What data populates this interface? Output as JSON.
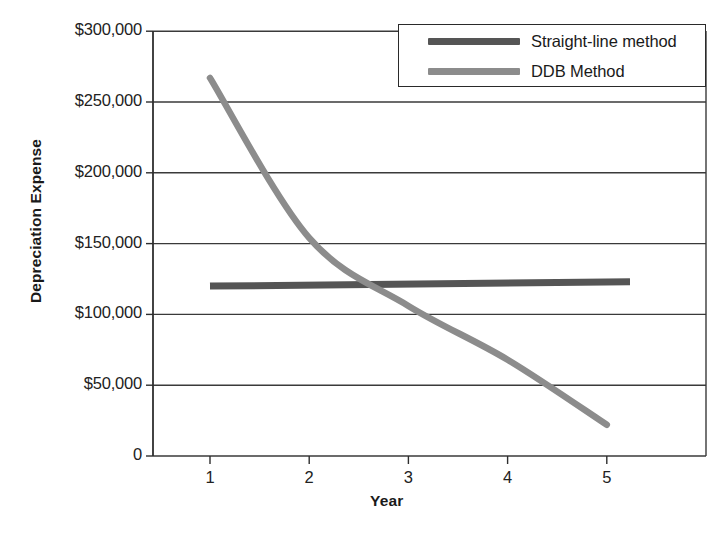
{
  "chart_data": {
    "type": "line",
    "title": "",
    "xlabel": "Year",
    "ylabel": "Depreciation Expense",
    "x": [
      1,
      2,
      3,
      4,
      5
    ],
    "xtick_labels": [
      "1",
      "2",
      "3",
      "4",
      "5"
    ],
    "xlim": [
      0.47,
      5.5
    ],
    "ylim": [
      0,
      300000
    ],
    "ytick_values": [
      0,
      50000,
      100000,
      150000,
      200000,
      250000,
      300000
    ],
    "ytick_labels": [
      "0",
      "$50,000",
      "$100,000",
      "$150,000",
      "$200,000",
      "$250,000",
      "$300,000"
    ],
    "grid": "horizontal",
    "legend_position": "top-right",
    "series": [
      {
        "name": "Straight-line method",
        "color": "#555555",
        "values": [
          120000,
          120750,
          121500,
          122250,
          123000
        ]
      },
      {
        "name": "DDB Method",
        "color": "#8c8c8c",
        "values": [
          267000,
          154000,
          106000,
          68000,
          22000
        ]
      }
    ]
  },
  "axes": {
    "x_title": "Year",
    "y_title": "Depreciation Expense"
  },
  "legend": {
    "items": [
      {
        "label": "Straight-line method",
        "color": "#555555"
      },
      {
        "label": "DDB Method",
        "color": "#8c8c8c"
      }
    ]
  },
  "geometry": {
    "plot_left": 153,
    "plot_right": 706,
    "plot_top": 31,
    "plot_bottom": 456,
    "x_year1": 210,
    "x_step": 99.2,
    "y_per_50k": 70.8,
    "straight_line_x_end": 630,
    "ddb_x_end": 608
  }
}
